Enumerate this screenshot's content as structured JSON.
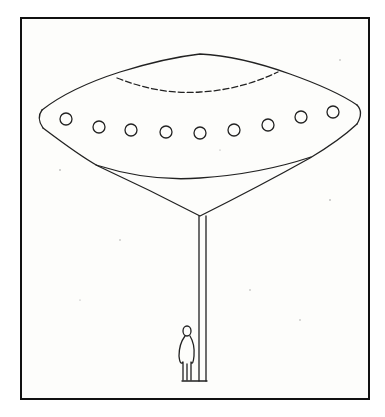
{
  "illustration": {
    "subject": "UFO drawing",
    "elements": [
      "flying saucer",
      "portholes",
      "beam column",
      "standing figure",
      "frame"
    ],
    "porthole_count": 9,
    "colors": {
      "ink": "#222222",
      "paper": "#fdfdfb",
      "frame": "#111111"
    }
  }
}
